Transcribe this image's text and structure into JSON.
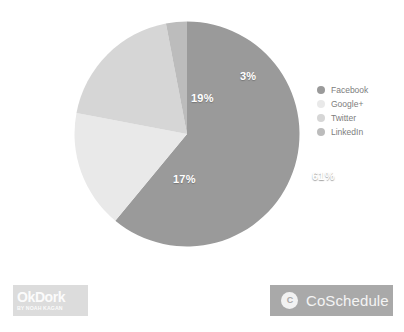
{
  "chart_data": {
    "type": "pie",
    "title": "",
    "categories": [
      "Facebook",
      "Google+",
      "Twitter",
      "LinkedIn"
    ],
    "values": [
      61,
      17,
      19,
      3
    ],
    "value_labels": [
      "61%",
      "17%",
      "19%",
      "3%"
    ],
    "colors": [
      "#9a9a9a",
      "#e9e9e9",
      "#d6d6d6",
      "#bcbcbc"
    ],
    "unit": "%",
    "legend_position": "right",
    "grid": false,
    "start_angle_deg": 0,
    "direction": "clockwise"
  },
  "slices": [
    {
      "name": "Facebook",
      "label": "61%",
      "color": "#9a9a9a",
      "label_left": "238px",
      "label_top": "149px"
    },
    {
      "name": "Google+",
      "label": "17%",
      "color": "#e9e9e9",
      "label_left": "99px",
      "label_top": "152px"
    },
    {
      "name": "Twitter",
      "label": "19%",
      "color": "#d6d6d6",
      "label_left": "117px",
      "label_top": "71px"
    },
    {
      "name": "LinkedIn",
      "label": "3%",
      "color": "#bcbcbc",
      "label_left": "166px",
      "label_top": "49px"
    }
  ],
  "legend": {
    "items": [
      {
        "label": "Facebook",
        "color": "#9a9a9a"
      },
      {
        "label": "Google+",
        "color": "#e9e9e9"
      },
      {
        "label": "Twitter",
        "color": "#d6d6d6"
      },
      {
        "label": "LinkedIn",
        "color": "#bcbcbc"
      }
    ]
  },
  "footer": {
    "okdork": {
      "wordmark": "OkDork",
      "tagline": "BY NOAH KAGAN",
      "background": "#dcdcdc",
      "text_color": "#fbfbfb"
    },
    "coschedule": {
      "wordmark": "CoSchedule",
      "badge_glyph": "C",
      "background": "#a9a9a9",
      "text_color": "#f4f4f4"
    }
  }
}
